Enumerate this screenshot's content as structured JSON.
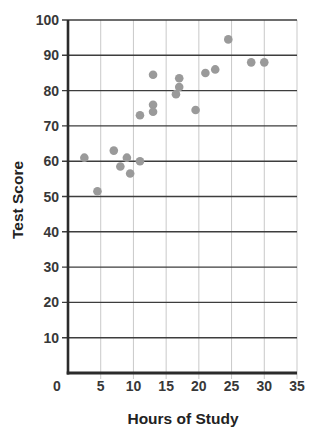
{
  "chart_data": {
    "type": "scatter",
    "title": "",
    "xlabel": "Hours of Study",
    "ylabel": "Test Score",
    "xlim": [
      0,
      35
    ],
    "ylim": [
      0,
      100
    ],
    "xticks": [
      0,
      5,
      10,
      15,
      20,
      25,
      30,
      35
    ],
    "yticks": [
      10,
      20,
      30,
      40,
      50,
      60,
      70,
      80,
      90,
      100
    ],
    "grid": {
      "horizontal": true,
      "vertical": true
    },
    "legend": "none",
    "points": [
      [
        2.5,
        61
      ],
      [
        4.5,
        51.5
      ],
      [
        7,
        63
      ],
      [
        8,
        58.5
      ],
      [
        9,
        61
      ],
      [
        9.5,
        56.5
      ],
      [
        11,
        60
      ],
      [
        11,
        73
      ],
      [
        13,
        84.5
      ],
      [
        13,
        76
      ],
      [
        13,
        74
      ],
      [
        16.5,
        79
      ],
      [
        17,
        83.5
      ],
      [
        17,
        81
      ],
      [
        19.5,
        74.5
      ],
      [
        21,
        85
      ],
      [
        22.5,
        86
      ],
      [
        24.5,
        94.5
      ],
      [
        28,
        88
      ],
      [
        30,
        88
      ]
    ],
    "colors": {
      "point": "#9a9a9a",
      "h_gridline": "#3d3d3d",
      "v_gridline": "#c9c9c9",
      "axis": "#2b2b2b",
      "tick_label": "#383838",
      "axis_title": "#222222",
      "background": "#ffffff"
    }
  }
}
